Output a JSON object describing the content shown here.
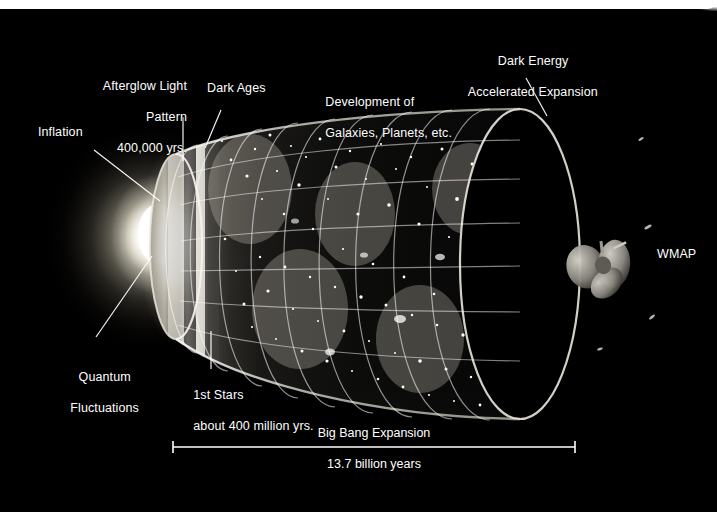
{
  "figure": {
    "background_color": "#000000",
    "text_color": "#ffffff",
    "page_edge_color": "#ffffff"
  },
  "labels": {
    "inflation": "Inflation",
    "afterglow_line1": "Afterglow Light",
    "afterglow_line2": "Pattern",
    "afterglow_line3": "400,000 yrs.",
    "dark_ages": "Dark Ages",
    "development_line1": "Development of",
    "development_line2": "Galaxies, Planets, etc.",
    "dark_energy_line1": "Dark Energy",
    "dark_energy_line2": "Accelerated Expansion",
    "wmap": "WMAP",
    "quantum_line1": "Quantum",
    "quantum_line2": "Fluctuations",
    "first_stars_line1": "1st Stars",
    "first_stars_line2": "about 400 million yrs."
  },
  "scale_bar": {
    "caption": "Big Bang Expansion",
    "value": "13.7 billion years",
    "left_x": 173,
    "right_x": 575,
    "y": 447
  },
  "icons": {
    "satellite": "wmap-satellite-icon",
    "expansion_cone": "universe-expansion-cone",
    "big-bang-glow": "big-bang-glow-icon"
  }
}
